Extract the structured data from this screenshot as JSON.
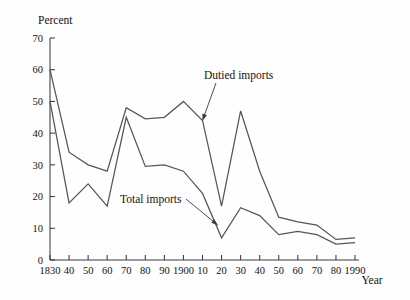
{
  "chart_data": {
    "type": "line",
    "title": "",
    "xlabel": "Year",
    "ylabel": "Percent",
    "ylim": [
      0,
      70
    ],
    "xlim": [
      1830,
      1990
    ],
    "grid": false,
    "legend_position": "inline-annotations",
    "y_ticks": [
      0,
      10,
      20,
      30,
      40,
      50,
      60,
      70
    ],
    "y_tick_labels": [
      "0",
      "10",
      "20",
      "30",
      "40",
      "50",
      "60",
      "70"
    ],
    "x_ticks": [
      1830,
      1840,
      1850,
      1860,
      1870,
      1880,
      1890,
      1900,
      1910,
      1920,
      1930,
      1940,
      1950,
      1960,
      1970,
      1980,
      1990
    ],
    "x_tick_labels": [
      "1830",
      "40",
      "50",
      "60",
      "70",
      "80",
      "90",
      "1900",
      "10",
      "20",
      "30",
      "40",
      "50",
      "60",
      "70",
      "80",
      "1990"
    ],
    "x": [
      1830,
      1840,
      1850,
      1860,
      1870,
      1880,
      1890,
      1900,
      1910,
      1920,
      1930,
      1940,
      1950,
      1960,
      1970,
      1980,
      1990
    ],
    "series": [
      {
        "name": "Dutied imports",
        "color": "#55565a",
        "values": [
          60,
          34,
          30,
          28,
          48,
          44.5,
          45,
          50,
          44,
          17,
          47,
          28,
          13.5,
          12,
          11,
          6.5,
          7
        ]
      },
      {
        "name": "Total imports",
        "color": "#55565a",
        "values": [
          50,
          18,
          24,
          17,
          45,
          29.5,
          30,
          28,
          21,
          7,
          16.5,
          14,
          8,
          9,
          8,
          5,
          5.5
        ]
      }
    ],
    "annotations": [
      {
        "text": "Dutied imports",
        "points_to_year": 1910,
        "points_to_value": 44
      },
      {
        "text": "Total imports",
        "points_to_year": 1918,
        "points_to_value": 11
      }
    ]
  }
}
